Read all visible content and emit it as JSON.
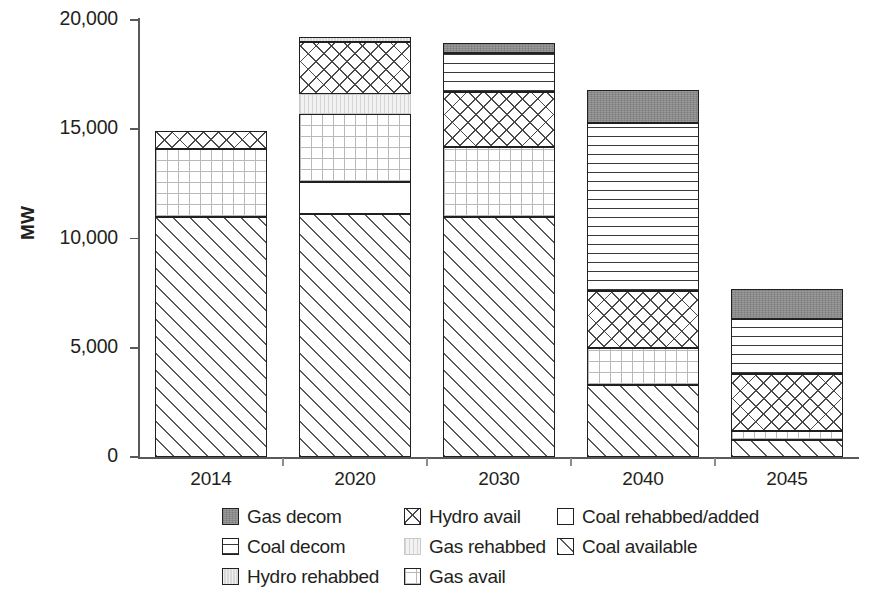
{
  "chart_data": {
    "type": "bar",
    "subtype": "stacked",
    "title": "",
    "xlabel": "",
    "ylabel": "MW",
    "ylim": [
      0,
      20000
    ],
    "ytick_labels": [
      "0",
      "5,000",
      "10,000",
      "15,000",
      "20,000"
    ],
    "ytick_values": [
      0,
      5000,
      10000,
      15000,
      20000
    ],
    "grid": false,
    "legend_position": "bottom",
    "categories": [
      "2014",
      "2020",
      "2030",
      "2040",
      "2045"
    ],
    "series": [
      {
        "name": "Coal available",
        "pattern": "diagonal-hatch",
        "values": [
          11000,
          11100,
          11000,
          3300,
          800
        ]
      },
      {
        "name": "Coal rehabbed/added",
        "pattern": "solid-white",
        "values": [
          0,
          1500,
          0,
          0,
          0
        ]
      },
      {
        "name": "Gas avail",
        "pattern": "fine-grid",
        "values": [
          3100,
          3100,
          3200,
          1700,
          400
        ]
      },
      {
        "name": "Gas rehabbed",
        "pattern": "very-light",
        "values": [
          0,
          900,
          0,
          0,
          0
        ]
      },
      {
        "name": "Hydro avail",
        "pattern": "crosshatch",
        "values": [
          800,
          2400,
          2500,
          2600,
          2600
        ]
      },
      {
        "name": "Hydro rehabbed",
        "pattern": "light-gray-dotted",
        "values": [
          0,
          200,
          0,
          0,
          0
        ]
      },
      {
        "name": "Coal decom",
        "pattern": "horizontal-lines",
        "values": [
          0,
          0,
          1800,
          7700,
          2500
        ]
      },
      {
        "name": "Gas decom",
        "pattern": "solid-gray",
        "values": [
          0,
          0,
          450,
          1500,
          1400
        ]
      }
    ],
    "totals": [
      14900,
      19200,
      18950,
      16800,
      7700
    ]
  },
  "axis": {
    "y_title": "MW"
  },
  "legend": {
    "items": [
      {
        "label": "Gas decom",
        "swatch": "solid-gray",
        "row": 0,
        "col": 0
      },
      {
        "label": "Hydro avail",
        "swatch": "crosshatch",
        "row": 0,
        "col": 1
      },
      {
        "label": "Coal rehabbed/added",
        "swatch": "solid-white",
        "row": 0,
        "col": 2
      },
      {
        "label": "Coal decom",
        "swatch": "horizontal-lines",
        "row": 1,
        "col": 0
      },
      {
        "label": "Gas rehabbed",
        "swatch": "very-light",
        "row": 1,
        "col": 1
      },
      {
        "label": "Coal available",
        "swatch": "diagonal-hatch",
        "row": 1,
        "col": 2
      },
      {
        "label": "Hydro rehabbed",
        "swatch": "light-gray-dotted",
        "row": 2,
        "col": 0
      },
      {
        "label": "Gas avail",
        "swatch": "fine-grid",
        "row": 2,
        "col": 1
      }
    ]
  },
  "colors": {
    "gas_decom": "#8a8a8a",
    "hydro_rehabbed": "#d9d9d9",
    "gas_rehabbed": "#f2f2f2",
    "outline": "#231f20",
    "axis": "#58595b",
    "background": "#ffffff"
  }
}
